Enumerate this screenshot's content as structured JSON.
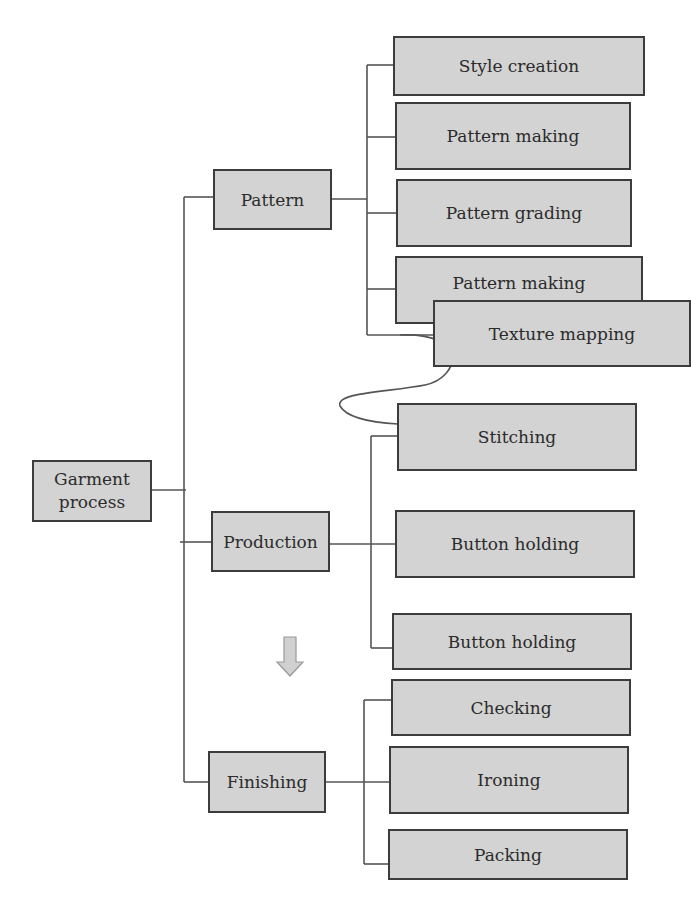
{
  "diagram": {
    "type": "hierarchy",
    "colors": {
      "box_fill": "#d3d3d3",
      "box_border": "#3c3c3c",
      "line": "#555555",
      "arrow_fill": "#d0d0d0"
    },
    "root": {
      "label_line1": "Garment",
      "label_line2": "process"
    },
    "categories": [
      {
        "label": "Pattern",
        "children": [
          "Style creation",
          "Pattern making",
          "Pattern grading",
          "Pattern making",
          "Texture mapping"
        ]
      },
      {
        "label": "Production",
        "children": [
          "Stitching",
          "Button holding",
          "Button holding"
        ]
      },
      {
        "label": "Finishing",
        "children": [
          "Checking",
          "Ironing",
          "Packing"
        ]
      }
    ],
    "annotations": {
      "down_arrow": "arrow-down-icon",
      "curve_connector": "texture-to-stitching"
    }
  }
}
